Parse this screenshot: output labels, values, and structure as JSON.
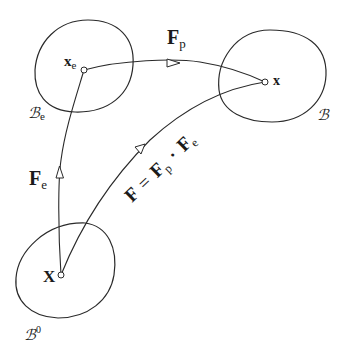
{
  "diagram": {
    "type": "multiplicative-decomposition-of-deformation-gradient",
    "configurations": {
      "reference": {
        "label": "ℬ",
        "superscript": "0",
        "point_label": "X"
      },
      "intermediate": {
        "label": "ℬ",
        "subscript": "e",
        "point_label": "x",
        "point_subscript": "e"
      },
      "current": {
        "label": "ℬ",
        "point_label": "x"
      }
    },
    "mappings": {
      "elastic": {
        "symbol": "F",
        "subscript": "e"
      },
      "plastic": {
        "symbol": "F",
        "subscript": "p"
      },
      "total": {
        "lhs": "F",
        "equals": "=",
        "f1": "F",
        "f1_sub": "p",
        "dot": "·",
        "f2": "F",
        "f2_sub": "e"
      }
    },
    "colors": {
      "stroke": "#2a2a2a",
      "text": "#1a1a1a",
      "background": "#ffffff"
    }
  }
}
